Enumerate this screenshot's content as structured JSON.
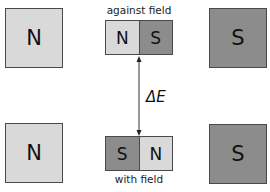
{
  "large_magnets": {
    "top_left": "N",
    "top_right": "S",
    "bottom_left": "N",
    "bottom_right": "S"
  },
  "small_magnet_top": {
    "left": "N",
    "right": "S",
    "label": "against field"
  },
  "small_magnet_bottom": {
    "left": "S",
    "right": "N",
    "label": "with field"
  },
  "energy_label": "ΔE",
  "colors": {
    "north": "#d9d9d9",
    "south": "#8c8c8c",
    "border": "#4a4a4a"
  }
}
